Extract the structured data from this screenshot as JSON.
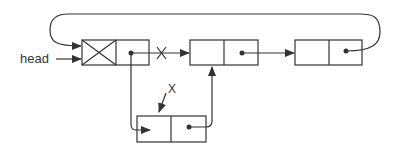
{
  "diagram": {
    "type": "circular-linked-list-insertion",
    "head_label": "head",
    "cut_marks": [
      "X",
      "X"
    ],
    "nodes": [
      {
        "id": "head-node",
        "data": "",
        "header": true
      },
      {
        "id": "node-2",
        "data": ""
      },
      {
        "id": "node-3",
        "data": ""
      },
      {
        "id": "new-node",
        "data": ""
      }
    ],
    "colors": {
      "stroke": "#333333",
      "background": "#ffffff"
    }
  }
}
